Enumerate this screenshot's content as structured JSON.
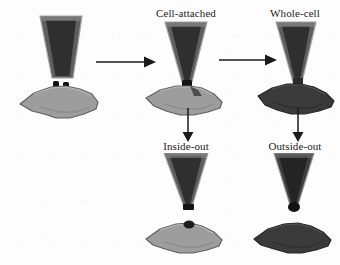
{
  "figure": {
    "background_color": "#fdfdfd"
  },
  "colors": {
    "pipette_wall": "#5e5e5e",
    "pipette_lumen": "#2f2f2f",
    "pipette_outline": "#9a9a9a",
    "cell_light": "#9d9d9d",
    "cell_light_edge": "#6b6b6b",
    "cell_dark": "#3a3a3a",
    "cell_dark_edge": "#262626",
    "membrane_patch": "#141414",
    "arrow": "#1a1a1a",
    "label_text": "#1b1b1b"
  },
  "panels": [
    {
      "id": "approach",
      "label": "",
      "description": "Glass micropipette positioned above an intact cell; membrane contact nubs visible",
      "pipette_state": "detached-above",
      "cell_state": "intact-light"
    },
    {
      "id": "cell-attached",
      "label": "Cell-attached",
      "description": "Pipette sealed onto intact cell membrane forming a gigaohm seal; membrane patch intact at tip",
      "pipette_state": "sealed",
      "cell_state": "intact-light"
    },
    {
      "id": "whole-cell",
      "label": "Whole-cell",
      "description": "Membrane patch ruptured; pipette interior continuous with cell cytoplasm",
      "pipette_state": "sealed",
      "cell_state": "dialyzed-dark"
    },
    {
      "id": "inside-out",
      "label": "Inside-out",
      "description": "Pipette withdrawn from cell-attached mode, excising a membrane patch with cytoplasmic face outward",
      "pipette_state": "withdrawn",
      "cell_state": "intact-light-separate"
    },
    {
      "id": "outside-out",
      "label": "Outside-out",
      "description": "Pipette withdrawn from whole-cell mode; membrane reseals with extracellular face outward",
      "pipette_state": "withdrawn-bleb",
      "cell_state": "dark-separate"
    }
  ],
  "arrows": [
    {
      "id": "approach-to-cell-attached",
      "direction": "right",
      "from": "approach",
      "to": "cell-attached"
    },
    {
      "id": "cell-attached-to-whole-cell",
      "direction": "right",
      "from": "cell-attached",
      "to": "whole-cell"
    },
    {
      "id": "cell-attached-to-inside-out",
      "direction": "down",
      "from": "cell-attached",
      "to": "inside-out"
    },
    {
      "id": "whole-cell-to-outside-out",
      "direction": "down",
      "from": "whole-cell",
      "to": "outside-out"
    }
  ]
}
